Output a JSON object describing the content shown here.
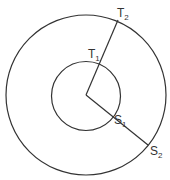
{
  "diagram": {
    "colors": {
      "stroke": "#333333",
      "background": "#ffffff"
    },
    "center": {
      "x": 86,
      "y": 95
    },
    "outer_circle": {
      "r": 80
    },
    "inner_circle": {
      "r": 34.5
    },
    "labels": {
      "T2": {
        "main": "T",
        "sub": "2"
      },
      "T1": {
        "main": "T",
        "sub": "1"
      },
      "S1": {
        "main": "S",
        "sub": "1"
      },
      "S2": {
        "main": "S",
        "sub": "2"
      }
    }
  }
}
